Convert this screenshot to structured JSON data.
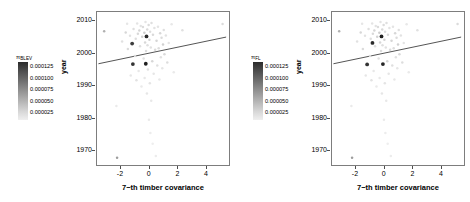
{
  "figure": {
    "background": "#ffffff",
    "panel_count": 2,
    "frame_color": "#7d7d7d",
    "point_color_scale": "grayscale",
    "regression_line_color": "#555555"
  },
  "chart_data": [
    {
      "type": "scatter",
      "panel": "left",
      "title": "",
      "xlabel": "7−th timber covariance",
      "ylabel": "year",
      "xlim": [
        -3.6,
        5.6
      ],
      "ylim": [
        1965.5,
        2012.5
      ],
      "xticks": [
        "-2",
        "0",
        "2",
        "4"
      ],
      "xtick_values": [
        -2,
        0,
        2,
        4
      ],
      "yticks": [
        "1970",
        "1980",
        "1990",
        "2000",
        "2010"
      ],
      "ytick_values": [
        1970,
        1980,
        1990,
        2000,
        2010
      ],
      "grid": false,
      "legend": {
        "position": "left",
        "title": "π",
        "title_subscript": "BLEV",
        "orientation": "vertical",
        "colormap": "grayscale-dark-to-light",
        "ticks": [
          "0.000125",
          "0.000100",
          "0.000075",
          "0.000050",
          "0.000025"
        ],
        "tick_values": [
          0.000125,
          0.0001,
          7.5e-05,
          5e-05,
          2.5e-05
        ]
      },
      "trendline": {
        "x": [
          -3.5,
          5.4
        ],
        "y": [
          1996.6,
          2004.8
        ]
      },
      "points": [
        {
          "x": -3.1,
          "y": 2006.6,
          "v": 5e-05
        },
        {
          "x": -2.25,
          "y": 1983.6,
          "v": 2e-05
        },
        {
          "x": -2.2,
          "y": 1967.7,
          "v": 6e-05
        },
        {
          "x": -1.85,
          "y": 2003.4,
          "v": 2.5e-05
        },
        {
          "x": -1.6,
          "y": 2006.2,
          "v": 3e-05
        },
        {
          "x": -1.5,
          "y": 2008.9,
          "v": 2.2e-05
        },
        {
          "x": -1.45,
          "y": 2001.1,
          "v": 2.8e-05
        },
        {
          "x": -1.3,
          "y": 2005.2,
          "v": 2.4e-05
        },
        {
          "x": -1.25,
          "y": 1993.0,
          "v": 2.2e-05
        },
        {
          "x": -1.15,
          "y": 2002.8,
          "v": 0.00011
        },
        {
          "x": -1.1,
          "y": 1996.5,
          "v": 0.000115
        },
        {
          "x": -1.05,
          "y": 2007.3,
          "v": 2.6e-05
        },
        {
          "x": -0.95,
          "y": 1999.0,
          "v": 3e-05
        },
        {
          "x": -0.9,
          "y": 2004.3,
          "v": 2.7e-05
        },
        {
          "x": -0.85,
          "y": 1991.5,
          "v": 2.4e-05
        },
        {
          "x": -0.8,
          "y": 2009.0,
          "v": 2.3e-05
        },
        {
          "x": -0.75,
          "y": 2005.8,
          "v": 2.9e-05
        },
        {
          "x": -0.7,
          "y": 1994.4,
          "v": 2.1e-05
        },
        {
          "x": -0.65,
          "y": 2006.8,
          "v": 3.1e-05
        },
        {
          "x": -0.6,
          "y": 2002.0,
          "v": 2.6e-05
        },
        {
          "x": -0.55,
          "y": 2008.2,
          "v": 2.4e-05
        },
        {
          "x": -0.5,
          "y": 1989.6,
          "v": 2e-05
        },
        {
          "x": -0.45,
          "y": 2004.9,
          "v": 3.3e-05
        },
        {
          "x": -0.4,
          "y": 2007.9,
          "v": 2.8e-05
        },
        {
          "x": -0.35,
          "y": 1998.2,
          "v": 2.5e-05
        },
        {
          "x": -0.3,
          "y": 2006.1,
          "v": 3.5e-05
        },
        {
          "x": -0.28,
          "y": 1992.2,
          "v": 2.1e-05
        },
        {
          "x": -0.25,
          "y": 2003.1,
          "v": 3e-05
        },
        {
          "x": -0.22,
          "y": 2009.4,
          "v": 2.3e-05
        },
        {
          "x": -0.2,
          "y": 1996.6,
          "v": 0.000125
        },
        {
          "x": -0.18,
          "y": 2000.5,
          "v": 2.7e-05
        },
        {
          "x": -0.15,
          "y": 2005.0,
          "v": 0.00012
        },
        {
          "x": -0.12,
          "y": 1987.5,
          "v": 2.2e-05
        },
        {
          "x": -0.1,
          "y": 2007.1,
          "v": 2.9e-05
        },
        {
          "x": -0.08,
          "y": 2002.3,
          "v": 2.6e-05
        },
        {
          "x": -0.05,
          "y": 1994.8,
          "v": 2.4e-05
        },
        {
          "x": 0.0,
          "y": 2008.5,
          "v": 2.8e-05
        },
        {
          "x": 0.02,
          "y": 1979.4,
          "v": 2e-05
        },
        {
          "x": 0.05,
          "y": 2004.0,
          "v": 3.2e-05
        },
        {
          "x": 0.08,
          "y": 1990.6,
          "v": 2.3e-05
        },
        {
          "x": 0.1,
          "y": 2006.4,
          "v": 2.7e-05
        },
        {
          "x": 0.12,
          "y": 1975.3,
          "v": 1.9e-05
        },
        {
          "x": 0.15,
          "y": 2001.6,
          "v": 2.5e-05
        },
        {
          "x": 0.18,
          "y": 1985.2,
          "v": 2.1e-05
        },
        {
          "x": 0.2,
          "y": 2009.1,
          "v": 2.6e-05
        },
        {
          "x": 0.25,
          "y": 1997.4,
          "v": 3e-05
        },
        {
          "x": 0.28,
          "y": 1972.0,
          "v": 1.8e-05
        },
        {
          "x": 0.3,
          "y": 2005.5,
          "v": 2.9e-05
        },
        {
          "x": 0.35,
          "y": 1993.5,
          "v": 2.2e-05
        },
        {
          "x": 0.4,
          "y": 2007.6,
          "v": 2.4e-05
        },
        {
          "x": 0.45,
          "y": 2000.9,
          "v": 2.8e-05
        },
        {
          "x": 0.5,
          "y": 1968.3,
          "v": 1.9e-05
        },
        {
          "x": 0.55,
          "y": 2003.7,
          "v": 3.1e-05
        },
        {
          "x": 0.6,
          "y": 1996.1,
          "v": 2.6e-05
        },
        {
          "x": 0.65,
          "y": 2008.0,
          "v": 2.3e-05
        },
        {
          "x": 0.7,
          "y": 2001.4,
          "v": 2.7e-05
        },
        {
          "x": 0.75,
          "y": 1991.8,
          "v": 2.1e-05
        },
        {
          "x": 0.8,
          "y": 2006.0,
          "v": 3e-05
        },
        {
          "x": 0.85,
          "y": 1998.6,
          "v": 2.5e-05
        },
        {
          "x": 0.9,
          "y": 2004.6,
          "v": 2.8e-05
        },
        {
          "x": 0.95,
          "y": 1995.2,
          "v": 2.2e-05
        },
        {
          "x": 1.0,
          "y": 2002.5,
          "v": 3.3e-05
        },
        {
          "x": 1.05,
          "y": 2007.0,
          "v": 2.6e-05
        },
        {
          "x": 1.1,
          "y": 1999.5,
          "v": 2.9e-05
        },
        {
          "x": 1.2,
          "y": 2005.3,
          "v": 2.4e-05
        },
        {
          "x": 1.3,
          "y": 1997.0,
          "v": 2.7e-05
        },
        {
          "x": 1.4,
          "y": 2003.0,
          "v": 2.3e-05
        },
        {
          "x": 1.6,
          "y": 2008.7,
          "v": 2.1e-05
        },
        {
          "x": 1.75,
          "y": 1994.0,
          "v": 2e-05
        },
        {
          "x": 2.35,
          "y": 2006.9,
          "v": 2.5e-05
        },
        {
          "x": 5.15,
          "y": 2008.8,
          "v": 2.8e-05
        }
      ]
    },
    {
      "type": "scatter",
      "panel": "right",
      "title": "",
      "xlabel": "7−th timber covariance",
      "ylabel": "year",
      "xlim": [
        -3.6,
        5.6
      ],
      "ylim": [
        1965.5,
        2012.5
      ],
      "xticks": [
        "-2",
        "0",
        "2",
        "4"
      ],
      "xtick_values": [
        -2,
        0,
        2,
        4
      ],
      "yticks": [
        "1970",
        "1980",
        "1990",
        "2000",
        "2010"
      ],
      "ytick_values": [
        1970,
        1980,
        1990,
        2000,
        2010
      ],
      "grid": false,
      "legend": {
        "position": "left",
        "title": "π",
        "title_subscript": "FL",
        "orientation": "vertical",
        "colormap": "grayscale-dark-to-light",
        "ticks": [
          "0.000125",
          "0.000100",
          "0.000075",
          "0.000050",
          "0.000025"
        ],
        "tick_values": [
          0.000125,
          0.0001,
          7.5e-05,
          5e-05,
          2.5e-05
        ]
      },
      "trendline": {
        "x": [
          -3.5,
          5.4
        ],
        "y": [
          1996.6,
          2004.8
        ]
      },
      "points": [
        {
          "x": -3.1,
          "y": 2006.6,
          "v": 5e-05
        },
        {
          "x": -2.25,
          "y": 1983.6,
          "v": 2e-05
        },
        {
          "x": -2.2,
          "y": 1967.7,
          "v": 6e-05
        },
        {
          "x": -1.85,
          "y": 2003.4,
          "v": 2.5e-05
        },
        {
          "x": -1.6,
          "y": 2006.2,
          "v": 3e-05
        },
        {
          "x": -1.5,
          "y": 2008.9,
          "v": 2.2e-05
        },
        {
          "x": -1.45,
          "y": 2001.1,
          "v": 2.8e-05
        },
        {
          "x": -1.3,
          "y": 2005.2,
          "v": 2.4e-05
        },
        {
          "x": -1.25,
          "y": 1993.0,
          "v": 2.2e-05
        },
        {
          "x": -1.15,
          "y": 1996.4,
          "v": 0.000115
        },
        {
          "x": -1.05,
          "y": 2007.3,
          "v": 2.6e-05
        },
        {
          "x": -0.95,
          "y": 1999.0,
          "v": 3e-05
        },
        {
          "x": -0.9,
          "y": 2004.3,
          "v": 2.7e-05
        },
        {
          "x": -0.85,
          "y": 1991.5,
          "v": 2.4e-05
        },
        {
          "x": -0.8,
          "y": 2009.0,
          "v": 2.3e-05
        },
        {
          "x": -0.78,
          "y": 2003.0,
          "v": 0.00012
        },
        {
          "x": -0.75,
          "y": 2005.8,
          "v": 2.9e-05
        },
        {
          "x": -0.7,
          "y": 1994.4,
          "v": 2.1e-05
        },
        {
          "x": -0.65,
          "y": 2006.8,
          "v": 3.1e-05
        },
        {
          "x": -0.6,
          "y": 2002.0,
          "v": 2.6e-05
        },
        {
          "x": -0.55,
          "y": 2008.2,
          "v": 2.4e-05
        },
        {
          "x": -0.5,
          "y": 1989.6,
          "v": 2e-05
        },
        {
          "x": -0.45,
          "y": 2004.9,
          "v": 3.3e-05
        },
        {
          "x": -0.4,
          "y": 2007.9,
          "v": 2.8e-05
        },
        {
          "x": -0.35,
          "y": 1998.2,
          "v": 2.5e-05
        },
        {
          "x": -0.3,
          "y": 2006.1,
          "v": 3.5e-05
        },
        {
          "x": -0.28,
          "y": 1992.2,
          "v": 2.1e-05
        },
        {
          "x": -0.25,
          "y": 2003.1,
          "v": 3e-05
        },
        {
          "x": -0.22,
          "y": 2009.4,
          "v": 2.3e-05
        },
        {
          "x": -0.18,
          "y": 2000.5,
          "v": 2.7e-05
        },
        {
          "x": -0.15,
          "y": 2005.0,
          "v": 0.000125
        },
        {
          "x": -0.12,
          "y": 1987.5,
          "v": 2.2e-05
        },
        {
          "x": -0.1,
          "y": 2007.1,
          "v": 2.9e-05
        },
        {
          "x": -0.08,
          "y": 2002.3,
          "v": 2.6e-05
        },
        {
          "x": -0.05,
          "y": 1996.5,
          "v": 0.000122
        },
        {
          "x": 0.0,
          "y": 2008.5,
          "v": 2.8e-05
        },
        {
          "x": 0.02,
          "y": 1979.4,
          "v": 2e-05
        },
        {
          "x": 0.05,
          "y": 2004.0,
          "v": 3.2e-05
        },
        {
          "x": 0.08,
          "y": 1990.6,
          "v": 2.3e-05
        },
        {
          "x": 0.1,
          "y": 2006.4,
          "v": 2.7e-05
        },
        {
          "x": 0.12,
          "y": 1975.3,
          "v": 1.9e-05
        },
        {
          "x": 0.15,
          "y": 2001.6,
          "v": 2.5e-05
        },
        {
          "x": 0.18,
          "y": 1985.2,
          "v": 2.1e-05
        },
        {
          "x": 0.2,
          "y": 2009.1,
          "v": 2.6e-05
        },
        {
          "x": 0.25,
          "y": 1997.4,
          "v": 3e-05
        },
        {
          "x": 0.28,
          "y": 1972.0,
          "v": 1.8e-05
        },
        {
          "x": 0.3,
          "y": 2005.5,
          "v": 2.9e-05
        },
        {
          "x": 0.35,
          "y": 1993.5,
          "v": 2.2e-05
        },
        {
          "x": 0.4,
          "y": 2007.6,
          "v": 2.4e-05
        },
        {
          "x": 0.45,
          "y": 2000.9,
          "v": 2.8e-05
        },
        {
          "x": 0.5,
          "y": 1968.3,
          "v": 1.9e-05
        },
        {
          "x": 0.55,
          "y": 2003.7,
          "v": 3.1e-05
        },
        {
          "x": 0.6,
          "y": 1996.1,
          "v": 2.6e-05
        },
        {
          "x": 0.65,
          "y": 2008.0,
          "v": 2.3e-05
        },
        {
          "x": 0.7,
          "y": 2001.4,
          "v": 2.7e-05
        },
        {
          "x": 0.75,
          "y": 1991.8,
          "v": 2.1e-05
        },
        {
          "x": 0.8,
          "y": 2006.0,
          "v": 3e-05
        },
        {
          "x": 0.85,
          "y": 1998.6,
          "v": 2.5e-05
        },
        {
          "x": 0.9,
          "y": 2004.6,
          "v": 2.8e-05
        },
        {
          "x": 0.95,
          "y": 1995.2,
          "v": 2.2e-05
        },
        {
          "x": 1.0,
          "y": 2002.5,
          "v": 3.3e-05
        },
        {
          "x": 1.05,
          "y": 2007.0,
          "v": 2.6e-05
        },
        {
          "x": 1.1,
          "y": 1999.5,
          "v": 2.9e-05
        },
        {
          "x": 1.2,
          "y": 2005.3,
          "v": 2.4e-05
        },
        {
          "x": 1.3,
          "y": 1997.0,
          "v": 2.7e-05
        },
        {
          "x": 1.4,
          "y": 2003.0,
          "v": 2.3e-05
        },
        {
          "x": 1.6,
          "y": 2008.7,
          "v": 2.1e-05
        },
        {
          "x": 1.75,
          "y": 1994.0,
          "v": 2e-05
        },
        {
          "x": 2.35,
          "y": 2006.9,
          "v": 2.5e-05
        },
        {
          "x": 5.15,
          "y": 2008.8,
          "v": 2.8e-05
        }
      ]
    }
  ]
}
